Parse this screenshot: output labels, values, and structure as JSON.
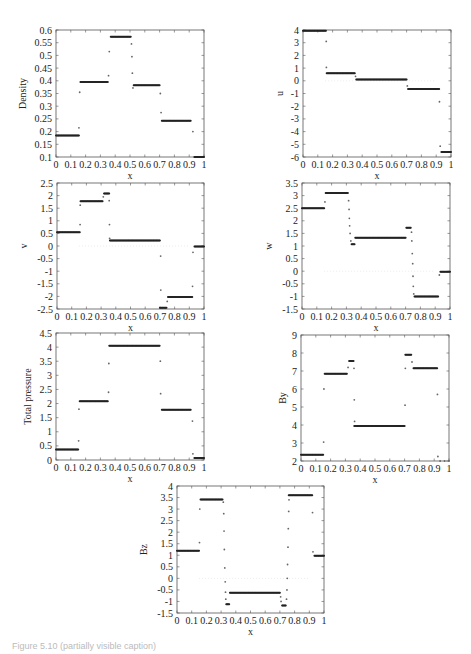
{
  "figure": {
    "caption": "Figure 5.10 (partially visible caption)"
  },
  "chart_data": [
    {
      "id": "density",
      "type": "scatter",
      "title": "",
      "xlabel": "x",
      "ylabel": "Density",
      "xlim": [
        0,
        1
      ],
      "ylim": [
        0.1,
        0.6
      ],
      "xticks": [
        "0",
        "0.1",
        "0.2",
        "0.3",
        "0.4",
        "0.5",
        "0.6",
        "0.7",
        "0.8",
        "0.9",
        "1"
      ],
      "yticks": [
        "0.1",
        "0.15",
        "0.2",
        "0.25",
        "0.3",
        "0.35",
        "0.4",
        "0.45",
        "0.5",
        "0.55",
        "0.6"
      ],
      "ytick_values": [
        0.1,
        0.15,
        0.2,
        0.25,
        0.3,
        0.35,
        0.4,
        0.45,
        0.5,
        0.55,
        0.6
      ],
      "grid": false,
      "box": {
        "left": 56,
        "top": 30,
        "width": 148,
        "height": 127
      },
      "segments": [
        [
          0,
          0.155,
          0.185
        ],
        [
          0.165,
          0.35,
          0.395
        ],
        [
          0.37,
          0.505,
          0.573
        ],
        [
          0.525,
          0.7,
          0.382
        ],
        [
          0.715,
          0.91,
          0.243
        ],
        [
          0.935,
          1,
          0.1
        ]
      ],
      "points": [
        [
          0.155,
          0.215
        ],
        [
          0.16,
          0.355
        ],
        [
          0.355,
          0.42
        ],
        [
          0.36,
          0.515
        ],
        [
          0.51,
          0.545
        ],
        [
          0.513,
          0.495
        ],
        [
          0.516,
          0.43
        ],
        [
          0.52,
          0.372
        ],
        [
          0.705,
          0.35
        ],
        [
          0.71,
          0.275
        ],
        [
          0.925,
          0.2
        ]
      ]
    },
    {
      "id": "u",
      "type": "scatter",
      "xlabel": "x",
      "ylabel": "u",
      "xlim": [
        0,
        1
      ],
      "ylim": [
        -6,
        4
      ],
      "xticks": [
        "0",
        "0.1",
        "0.2",
        "0.3",
        "0.4",
        "0.5",
        "0.6",
        "0.7",
        "0.8",
        "0.9",
        "1"
      ],
      "yticks": [
        "-6",
        "-5",
        "-4",
        "-3",
        "-2",
        "-1",
        "0",
        "1",
        "2",
        "3",
        "4"
      ],
      "ytick_values": [
        -6,
        -5,
        -4,
        -3,
        -2,
        -1,
        0,
        1,
        2,
        3,
        4
      ],
      "grid": false,
      "box": {
        "left": 303,
        "top": 30,
        "width": 148,
        "height": 127
      },
      "segments": [
        [
          0,
          0.155,
          3.95
        ],
        [
          0.16,
          0.35,
          0.6
        ],
        [
          0.36,
          0.7,
          0.1
        ],
        [
          0.71,
          0.92,
          -0.65
        ],
        [
          0.935,
          1,
          -5.6
        ]
      ],
      "points": [
        [
          0.157,
          3.1
        ],
        [
          0.158,
          1.05
        ],
        [
          0.355,
          0.35
        ],
        [
          0.705,
          -0.4
        ],
        [
          0.922,
          -1.65
        ],
        [
          0.927,
          -5.15
        ]
      ]
    },
    {
      "id": "v",
      "type": "scatter",
      "xlabel": "x",
      "ylabel": "v",
      "xlim": [
        0,
        1
      ],
      "ylim": [
        -2.5,
        2.5
      ],
      "xticks": [
        "0",
        "0.1",
        "0.2",
        "0.3",
        "0.4",
        "0.5",
        "0.6",
        "0.7",
        "0.8",
        "0.9",
        "1"
      ],
      "yticks": [
        "-2.5",
        "-2",
        "-1.5",
        "-1",
        "-0.5",
        "0",
        "0.5",
        "1",
        "1.5",
        "2",
        "2.5"
      ],
      "ytick_values": [
        -2.5,
        -2,
        -1.5,
        -1,
        -0.5,
        0,
        0.5,
        1,
        1.5,
        2,
        2.5
      ],
      "grid": false,
      "box": {
        "left": 57,
        "top": 183,
        "width": 147,
        "height": 126
      },
      "segments": [
        [
          0,
          0.155,
          0.55
        ],
        [
          0.16,
          0.31,
          1.78
        ],
        [
          0.32,
          0.355,
          2.08
        ],
        [
          0.36,
          0.7,
          0.22
        ],
        [
          0.7,
          0.745,
          -2.45
        ],
        [
          0.755,
          0.92,
          -2.02
        ],
        [
          0.935,
          1,
          -0.02
        ]
      ],
      "points": [
        [
          0.157,
          0.85
        ],
        [
          0.158,
          1.62
        ],
        [
          0.315,
          1.95
        ],
        [
          0.355,
          1.8
        ],
        [
          0.357,
          0.85
        ],
        [
          0.358,
          0.3
        ],
        [
          0.705,
          -0.4
        ],
        [
          0.706,
          -1.75
        ],
        [
          0.75,
          -2.2
        ],
        [
          0.922,
          -1.6
        ],
        [
          0.925,
          -0.25
        ]
      ]
    },
    {
      "id": "w",
      "type": "scatter",
      "xlabel": "x",
      "ylabel": "w",
      "xlim": [
        0,
        1
      ],
      "ylim": [
        -1.5,
        3.5
      ],
      "xticks": [
        "0",
        "0.1",
        "0.2",
        "0.3",
        "0.4",
        "0.5",
        "0.6",
        "0.7",
        "0.8",
        "0.9",
        "1"
      ],
      "yticks": [
        "-1.5",
        "-1",
        "-0.5",
        "0",
        "0.5",
        "1",
        "1.5",
        "2",
        "2.5",
        "3",
        "3.5"
      ],
      "ytick_values": [
        -1.5,
        -1,
        -0.5,
        0,
        0.5,
        1,
        1.5,
        2,
        2.5,
        3,
        3.5
      ],
      "grid": false,
      "box": {
        "left": 302,
        "top": 183,
        "width": 148,
        "height": 126
      },
      "segments": [
        [
          0,
          0.15,
          2.5
        ],
        [
          0.16,
          0.31,
          3.1
        ],
        [
          0.335,
          0.355,
          1.07
        ],
        [
          0.36,
          0.7,
          1.33
        ],
        [
          0.705,
          0.735,
          1.72
        ],
        [
          0.76,
          0.92,
          -1.0
        ],
        [
          0.935,
          1,
          -0.02
        ]
      ],
      "points": [
        [
          0.155,
          2.75
        ],
        [
          0.315,
          2.8
        ],
        [
          0.318,
          2.45
        ],
        [
          0.32,
          2.1
        ],
        [
          0.322,
          1.8
        ],
        [
          0.325,
          1.5
        ],
        [
          0.33,
          1.2
        ],
        [
          0.74,
          1.55
        ],
        [
          0.742,
          1.2
        ],
        [
          0.745,
          0.7
        ],
        [
          0.748,
          0.3
        ],
        [
          0.75,
          -0.2
        ],
        [
          0.752,
          -0.6
        ],
        [
          0.755,
          -0.9
        ],
        [
          0.928,
          -0.15
        ]
      ]
    },
    {
      "id": "total_pressure",
      "type": "scatter",
      "xlabel": "x",
      "ylabel": "Total pressure",
      "xlim": [
        0,
        1
      ],
      "ylim": [
        0,
        4.5
      ],
      "xticks": [
        "0",
        "0.1",
        "0.2",
        "0.3",
        "0.4",
        "0.5",
        "0.6",
        "0.7",
        "0.8",
        "0.9",
        "1"
      ],
      "yticks": [
        "0",
        "0.5",
        "1",
        "1.5",
        "2",
        "2.5",
        "3",
        "3.5",
        "4",
        "4.5"
      ],
      "ytick_values": [
        0,
        0.5,
        1,
        1.5,
        2,
        2.5,
        3,
        3.5,
        4,
        4.5
      ],
      "grid": false,
      "box": {
        "left": 56,
        "top": 333,
        "width": 148,
        "height": 127
      },
      "segments": [
        [
          0,
          0.15,
          0.37
        ],
        [
          0.16,
          0.35,
          2.08
        ],
        [
          0.36,
          0.7,
          4.05
        ],
        [
          0.715,
          0.91,
          1.78
        ],
        [
          0.935,
          1,
          0.07
        ]
      ],
      "points": [
        [
          0.153,
          0.68
        ],
        [
          0.155,
          1.8
        ],
        [
          0.355,
          2.4
        ],
        [
          0.357,
          3.42
        ],
        [
          0.705,
          3.5
        ],
        [
          0.707,
          2.35
        ],
        [
          0.922,
          1.38
        ],
        [
          0.925,
          0.22
        ]
      ]
    },
    {
      "id": "By",
      "type": "scatter",
      "xlabel": "x",
      "ylabel": "By",
      "xlim": [
        0,
        1
      ],
      "ylim": [
        2,
        9
      ],
      "xticks": [
        "0",
        "0.1",
        "0.2",
        "0.3",
        "0.4",
        "0.5",
        "0.6",
        "0.7",
        "0.8",
        "0.9",
        "1"
      ],
      "yticks": [
        "2",
        "3",
        "4",
        "5",
        "6",
        "7",
        "8",
        "9"
      ],
      "ytick_values": [
        2,
        3,
        4,
        5,
        6,
        7,
        8,
        9
      ],
      "grid": false,
      "box": {
        "left": 301,
        "top": 335,
        "width": 148,
        "height": 126
      },
      "segments": [
        [
          0,
          0.15,
          2.35
        ],
        [
          0.16,
          0.31,
          6.85
        ],
        [
          0.325,
          0.355,
          7.55
        ],
        [
          0.36,
          0.7,
          3.95
        ],
        [
          0.705,
          0.745,
          7.9
        ],
        [
          0.76,
          0.92,
          7.15
        ]
      ],
      "points": [
        [
          0.153,
          3.05
        ],
        [
          0.155,
          6.0
        ],
        [
          0.318,
          7.2
        ],
        [
          0.358,
          7.15
        ],
        [
          0.36,
          5.4
        ],
        [
          0.362,
          4.2
        ],
        [
          0.703,
          5.1
        ],
        [
          0.705,
          7.15
        ],
        [
          0.75,
          7.5
        ],
        [
          0.922,
          5.7
        ],
        [
          0.925,
          2.25
        ],
        [
          0.94,
          2.0
        ],
        [
          0.97,
          2.0
        ],
        [
          1.0,
          2.0
        ]
      ]
    },
    {
      "id": "Bz",
      "type": "scatter",
      "xlabel": "x",
      "ylabel": "Bz",
      "xlim": [
        0,
        1
      ],
      "ylim": [
        -1.5,
        4
      ],
      "xticks": [
        "0",
        "0.1",
        "0.2",
        "0.3",
        "0.4",
        "0.5",
        "0.6",
        "0.7",
        "0.8",
        "0.9",
        "1"
      ],
      "yticks": [
        "-1.5",
        "-1",
        "-0.5",
        "0",
        "0.5",
        "1",
        "1.5",
        "2",
        "2.5",
        "3",
        "3.5",
        "4"
      ],
      "ytick_values": [
        -1.5,
        -1,
        -0.5,
        0,
        0.5,
        1,
        1.5,
        2,
        2.5,
        3,
        3.5,
        4
      ],
      "grid": false,
      "box": {
        "left": 177,
        "top": 486,
        "width": 147,
        "height": 127
      },
      "segments": [
        [
          0,
          0.15,
          1.2
        ],
        [
          0.16,
          0.31,
          3.42
        ],
        [
          0.335,
          0.355,
          -1.12
        ],
        [
          0.36,
          0.7,
          -0.62
        ],
        [
          0.715,
          0.74,
          -1.18
        ],
        [
          0.76,
          0.92,
          3.6
        ],
        [
          0.935,
          1,
          0.98
        ]
      ],
      "points": [
        [
          0.153,
          1.55
        ],
        [
          0.155,
          3.0
        ],
        [
          0.315,
          3.3
        ],
        [
          0.318,
          2.8
        ],
        [
          0.32,
          2.05
        ],
        [
          0.322,
          1.25
        ],
        [
          0.325,
          0.45
        ],
        [
          0.328,
          -0.15
        ],
        [
          0.33,
          -0.6
        ],
        [
          0.332,
          -0.9
        ],
        [
          0.705,
          -0.8
        ],
        [
          0.708,
          -1.0
        ],
        [
          0.745,
          -0.9
        ],
        [
          0.748,
          -0.5
        ],
        [
          0.75,
          0.0
        ],
        [
          0.752,
          0.6
        ],
        [
          0.755,
          1.35
        ],
        [
          0.757,
          2.15
        ],
        [
          0.76,
          2.9
        ],
        [
          0.762,
          3.4
        ],
        [
          0.922,
          2.85
        ],
        [
          0.925,
          1.15
        ]
      ]
    }
  ]
}
